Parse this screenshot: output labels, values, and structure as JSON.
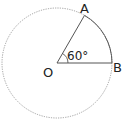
{
  "diagram": {
    "type": "circle-sector",
    "center_label": "O",
    "point_a_label": "A",
    "point_b_label": "B",
    "angle_label": "60°",
    "angle_degrees": 60,
    "colors": {
      "stroke": "#555555",
      "text": "#222222",
      "dotted_circle": "#777777"
    }
  }
}
